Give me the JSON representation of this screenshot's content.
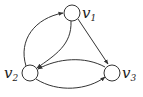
{
  "diagram": {
    "type": "directed-graph",
    "nodes": [
      {
        "id": "v1",
        "label": "v",
        "sub": "1"
      },
      {
        "id": "v2",
        "label": "v",
        "sub": "2"
      },
      {
        "id": "v3",
        "label": "v",
        "sub": "3"
      }
    ],
    "edges": [
      {
        "from": "v2",
        "to": "v1"
      },
      {
        "from": "v1",
        "to": "v2"
      },
      {
        "from": "v1",
        "to": "v3"
      },
      {
        "from": "v3",
        "to": "v2"
      },
      {
        "from": "v2",
        "to": "v3"
      }
    ],
    "colors": {
      "stroke": "#333333",
      "background": "#ffffff"
    }
  }
}
